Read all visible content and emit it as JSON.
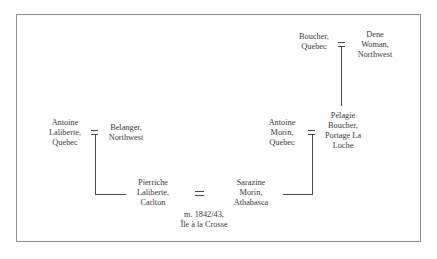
{
  "diagram": {
    "type": "genealogy",
    "people": {
      "boucher_quebec": "Boucher,\nQuebec",
      "dene_woman": "Dene\nWoman,\nNorthwest",
      "antoine_laliberte": "Antoine\nLaliberte,\nQuebec",
      "belanger": "Belanger,\nNorthwest",
      "antoine_morin": "Antoine\nMorin,\nQuebec",
      "pelagie_boucher": "Pélagie\nBoucher,\nPortage La\nLoche",
      "pierriche_laliberte": "Pierriche\nLaliberte,\nCarlton",
      "sarazine_morin": "Sarazine\nMorin,\nAthabasca"
    },
    "marriage_note": "m. 1842/43,\nÎle à la Crosse",
    "unions": [
      {
        "partners": [
          "Boucher, Quebec",
          "Dene Woman, Northwest"
        ],
        "child": "Pélagie Boucher, Portage La Loche"
      },
      {
        "partners": [
          "Antoine Laliberte, Quebec",
          "Belanger, Northwest"
        ],
        "child": "Pierriche Laliberte, Carlton"
      },
      {
        "partners": [
          "Antoine Morin, Quebec",
          "Pélagie Boucher, Portage La Loche"
        ],
        "child": "Sarazine Morin, Athabasca"
      },
      {
        "partners": [
          "Pierriche Laliberte, Carlton",
          "Sarazine Morin, Athabasca"
        ],
        "note": "m. 1842/43, Île à la Crosse"
      }
    ]
  }
}
